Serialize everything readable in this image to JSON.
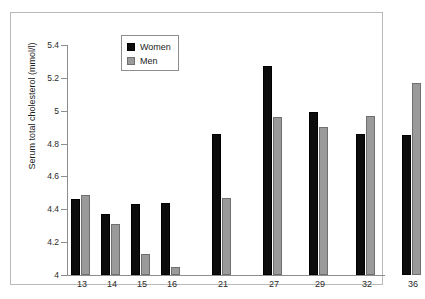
{
  "chart_data": {
    "type": "bar",
    "title": "",
    "xlabel": "",
    "ylabel": "Serum total cholesterol (mmol/l)",
    "ylim": [
      4,
      5.4
    ],
    "yticks": [
      "4",
      "4.2",
      "4.4",
      "4.6",
      "4.8",
      "5",
      "5.2",
      "5.4"
    ],
    "ytick_values": [
      4,
      4.2,
      4.4,
      4.6,
      4.8,
      5,
      5.2,
      5.4
    ],
    "grid": false,
    "legend_position": "top-left",
    "categories": [
      "13",
      "14",
      "15",
      "16",
      "21",
      "27",
      "29",
      "32",
      "36"
    ],
    "series": [
      {
        "name": "Women",
        "color": "#0c0c0c",
        "values": [
          4.46,
          4.37,
          4.43,
          4.44,
          4.86,
          5.27,
          4.99,
          4.86,
          4.85
        ]
      },
      {
        "name": "Men",
        "color": "#9a9a9a",
        "values": [
          4.49,
          4.31,
          4.13,
          4.05,
          4.47,
          4.96,
          4.9,
          4.97,
          5.17
        ]
      }
    ]
  },
  "legend": {
    "items": [
      {
        "label": "Women",
        "swatch": "black-square-icon"
      },
      {
        "label": "Men",
        "swatch": "gray-square-icon"
      }
    ]
  }
}
